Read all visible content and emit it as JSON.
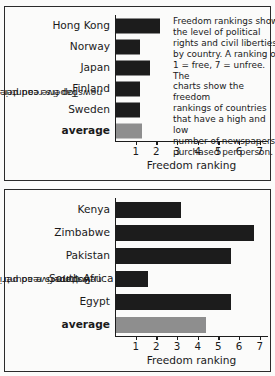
{
  "chart_data": [
    {
      "type": "bar",
      "orientation": "horizontal",
      "panel": "top",
      "title": "",
      "ylabel": "Top five countries (most newspapers read per person)",
      "ylabel_line1": "Top five countries (most",
      "ylabel_line2": "newspapers read per person)",
      "xlabel": "Freedom ranking",
      "categories": [
        "Hong Kong",
        "Norway",
        "Japan",
        "Finland",
        "Sweden",
        "average"
      ],
      "values": [
        2.2,
        1.2,
        1.7,
        1.2,
        1.2,
        1.3
      ],
      "bar_colors": [
        "#1c1c1c",
        "#1c1c1c",
        "#1c1c1c",
        "#1c1c1c",
        "#1c1c1c",
        "#8e8e8e"
      ],
      "highlight_category": "average",
      "xlim": [
        0,
        7.4
      ],
      "xticks": [
        1,
        2,
        3,
        4,
        5,
        6,
        7
      ],
      "xticklabels": [
        "1",
        "2",
        "3",
        "4",
        "5",
        "6",
        "7"
      ],
      "grid": false,
      "legend": null,
      "annotation": "Freedom rankings show the level of political rights and civil liberties by country. A ranking of 1 = free, 7 = unfree. The charts show the freedom rankings of countries that have a high and low number of newspapers purchased per person.",
      "annotation_lines": [
        "Freedom rankings show",
        "the level of political",
        "rights and civil liberties",
        "by country. A ranking of",
        "1 = free, 7 = unfree. The",
        "charts show the freedom",
        "rankings of countries",
        "that have a high and low",
        "number of newspapers",
        "purchased per person."
      ]
    },
    {
      "type": "bar",
      "orientation": "horizontal",
      "panel": "bottom",
      "title": "",
      "ylabel": "Bottom five countries (fewest newspapers read per person)",
      "ylabel_line1": "Bottom five countries (fewest",
      "ylabel_line2": "newspapers read per person)",
      "xlabel": "Freedom ranking",
      "categories": [
        "Kenya",
        "Zimbabwe",
        "Pakistan",
        "South Africa",
        "Egypt",
        "average"
      ],
      "values": [
        3.2,
        6.7,
        5.6,
        1.6,
        5.6,
        4.4
      ],
      "bar_colors": [
        "#1c1c1c",
        "#1c1c1c",
        "#1c1c1c",
        "#1c1c1c",
        "#1c1c1c",
        "#8e8e8e"
      ],
      "highlight_category": "average",
      "xlim": [
        0,
        7.4
      ],
      "xticks": [
        1,
        2,
        3,
        4,
        5,
        6,
        7
      ],
      "xticklabels": [
        "1",
        "2",
        "3",
        "4",
        "5",
        "6",
        "7"
      ],
      "grid": false,
      "legend": null,
      "annotation": null
    }
  ],
  "colors": {
    "bar_dark": "#1c1c1c",
    "bar_gray": "#8e8e8e",
    "axis": "#1c1c1c",
    "background": "#fbfbfa",
    "text": "#1a1a1a"
  }
}
